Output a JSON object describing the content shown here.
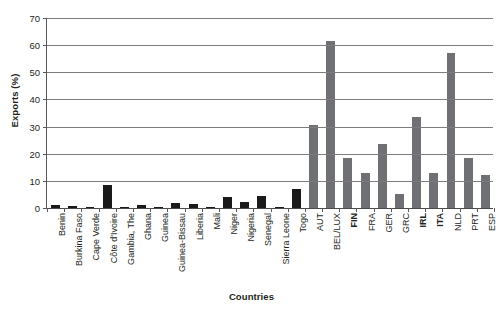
{
  "axis": {
    "y_title": "Exports (%)",
    "x_title": "Countries",
    "y_ticks": [
      "0",
      "10",
      "20",
      "30",
      "40",
      "50",
      "60",
      "70"
    ]
  },
  "title_remnant": "",
  "chart_data": {
    "type": "bar",
    "title": "",
    "xlabel": "Countries",
    "ylabel": "Exports (%)",
    "ylim": [
      0,
      70
    ],
    "ytick_step": 10,
    "grid": true,
    "legend": "none",
    "orientation": "vertical",
    "groups": [
      {
        "name": "West Africa",
        "color": "#1a1a1a",
        "categories": [
          "Benin",
          "Burkina Faso",
          "Cape Verde",
          "Côte d'Ivoire",
          "Gambia, The",
          "Ghana",
          "Guinea",
          "Guinea-Bissau",
          "Liberia",
          "Mali",
          "Niger",
          "Nigeria",
          "Senegal",
          "Sierra Leone",
          "Togo"
        ],
        "values": [
          1.2,
          0.7,
          0.4,
          8.5,
          0.4,
          1.2,
          0.5,
          1.7,
          1.3,
          0.4,
          4.0,
          2.3,
          4.5,
          0.5,
          7.0
        ],
        "bold_labels": []
      },
      {
        "name": "Europe",
        "color": "#6f7073",
        "categories": [
          "AUT",
          "BEL/LUX",
          "FIN",
          "FRA",
          "GER",
          "GRC",
          "IRL",
          "ITA",
          "NLD",
          "PRT",
          "ESP"
        ],
        "values": [
          30.5,
          61.5,
          18.5,
          13.0,
          23.5,
          5.0,
          33.5,
          13.0,
          57.0,
          18.5,
          12.0
        ],
        "bold_labels": [
          "FIN",
          "IRL",
          "ITA"
        ]
      }
    ]
  },
  "colors": {
    "africa_bar": "#1a1a1a",
    "europe_bar": "#6f7073",
    "gridline": "#7d7d80",
    "axis": "#58585a",
    "text": "#231f20",
    "background": "#ffffff"
  }
}
